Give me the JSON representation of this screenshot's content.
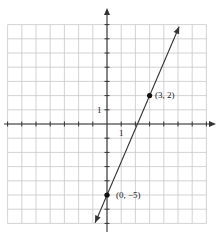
{
  "graph": {
    "title": "Line through (3, 2) and (0, -5)",
    "grid": {
      "xmin": -7,
      "xmax": 7,
      "ymin": -7,
      "ymax": 7,
      "step": 1
    },
    "axes": {
      "x_tick_label": "1",
      "y_tick_label": "1"
    },
    "points": [
      {
        "label": "(3, 2)",
        "x": 3,
        "y": 2
      },
      {
        "label": "(0, −5)",
        "x": 0,
        "y": -5
      }
    ],
    "line": {
      "slope": 2.3333,
      "intercept": -5,
      "equation": "y = (7/3)x - 5"
    },
    "colors": {
      "grid": "#c8c8c8",
      "axis": "#333333",
      "line": "#333333",
      "point": "#111111"
    }
  },
  "chart_data": {
    "type": "line",
    "title": "",
    "xlabel": "",
    "ylabel": "",
    "xlim": [
      -7,
      7
    ],
    "ylim": [
      -7,
      7
    ],
    "grid": true,
    "series": [
      {
        "name": "line",
        "x": [
          0,
          3
        ],
        "y": [
          -5,
          2
        ]
      }
    ],
    "annotations": [
      "(3, 2)",
      "(0, −5)",
      "1",
      "1"
    ]
  }
}
